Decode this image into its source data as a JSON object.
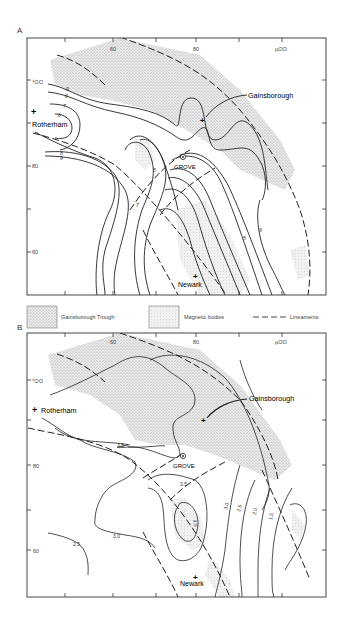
{
  "figure": {
    "panels": [
      {
        "id": "A",
        "label": "A",
        "x_ticks": [
          "60",
          "80",
          "500"
        ],
        "x_tick_labels_display": [
          "60",
          "80",
          "µ00"
        ],
        "y_ticks": [
          "400",
          "80",
          "60"
        ],
        "y_tick_labels_display": [
          "⁴OO",
          "80",
          "60"
        ],
        "places": [
          "Rotherham",
          "Gainsborough",
          "GROVE",
          "Newark"
        ],
        "contour_labels": [
          "9",
          "8",
          "7",
          "6",
          "5",
          "5",
          "7",
          "8",
          "9",
          "3",
          "4",
          "5",
          "6",
          "8",
          "9",
          "10",
          "5",
          "9"
        ]
      },
      {
        "id": "B",
        "label": "B",
        "x_ticks": [
          "60",
          "80",
          "500"
        ],
        "x_tick_labels_display": [
          "60",
          "80",
          "µ00"
        ],
        "y_ticks": [
          "400",
          "80",
          "60"
        ],
        "y_tick_labels_display": [
          "⁴OO",
          "80",
          "60"
        ],
        "places": [
          "Rotherham",
          "Gainsborough",
          "GROVE",
          "Newark"
        ],
        "contour_labels": [
          "3.5",
          "3.5",
          "4.0",
          "3.0",
          "3.0",
          "2.5",
          "2.5",
          "2.0",
          "1.5"
        ]
      }
    ],
    "legend": [
      {
        "symbol": "stipple-dense",
        "label": "Gainsborough Trough"
      },
      {
        "symbol": "stipple-light",
        "label": "Magnetic bodies"
      },
      {
        "symbol": "dashed-line",
        "label": "Lineaments"
      }
    ],
    "labels": {
      "panel_a": "A",
      "panel_b": "B",
      "rotherham": "Rotherham",
      "gainsborough": "Gainsborough",
      "grove": "GROVE",
      "newark": "Newark",
      "tick_60": "60",
      "tick_80": "80",
      "tick_500": "µOO",
      "tick_400": "⁴OO",
      "legend_trough": "Gainsborough Trough",
      "legend_magnetic": "Magnetic bodies",
      "legend_lineaments": "Lineaments",
      "a_c9": "9",
      "a_c8": "8",
      "a_c7": "7",
      "a_c6": "6",
      "a_c5": "5",
      "a_c7b": "7",
      "a_c8b": "8",
      "a_c9b": "9",
      "a_c9c": "9",
      "a_c5b": "5",
      "b_c35a": "3.5",
      "b_c35b": "3.5",
      "b_c40": "4.0",
      "b_c30a": "3.0",
      "b_c30b": "3.0",
      "b_c25a": "2.5",
      "b_c25b": "2.5",
      "b_c20": "2.0",
      "b_c15": "1.5"
    },
    "colors": {
      "stipple": "#bdbdbd",
      "line": "#222222",
      "frame": "#333333"
    }
  }
}
